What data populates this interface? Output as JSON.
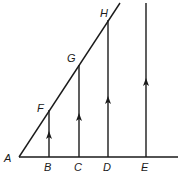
{
  "diagram": {
    "baseline": {
      "from": [
        19,
        157
      ],
      "to": [
        178,
        157
      ]
    },
    "diagonal": {
      "from": [
        19,
        157
      ],
      "to": [
        120,
        3
      ]
    },
    "points": [
      {
        "label": "A",
        "x": 19,
        "y": 157,
        "label_x": 4,
        "label_y": 162
      },
      {
        "label": "B",
        "x": 49,
        "y": 157,
        "label_x": 44,
        "label_y": 171
      },
      {
        "label": "C",
        "x": 79,
        "y": 157,
        "label_x": 74,
        "label_y": 171
      },
      {
        "label": "D",
        "x": 108,
        "y": 157,
        "label_x": 103,
        "label_y": 171
      },
      {
        "label": "E",
        "x": 146,
        "y": 157,
        "label_x": 141,
        "label_y": 171
      },
      {
        "label": "F",
        "x": 49,
        "y": 110,
        "label_x": 37,
        "label_y": 112
      },
      {
        "label": "G",
        "x": 79,
        "y": 65,
        "label_x": 67,
        "label_y": 62
      },
      {
        "label": "H",
        "x": 108,
        "y": 20,
        "label_x": 100,
        "label_y": 17
      }
    ],
    "verticals": [
      {
        "name": "BF",
        "x": 49,
        "y_top": 110,
        "y_bottom": 157,
        "arrow_y": 135
      },
      {
        "name": "CG",
        "x": 79,
        "y_top": 65,
        "y_bottom": 157,
        "arrow_y": 117
      },
      {
        "name": "DH",
        "x": 108,
        "y_top": 20,
        "y_bottom": 157,
        "arrow_y": 100
      },
      {
        "name": "E",
        "x": 146,
        "y_top": 3,
        "y_bottom": 157,
        "arrow_y": 82
      }
    ]
  },
  "labels": {
    "A": "A",
    "B": "B",
    "C": "C",
    "D": "D",
    "E": "E",
    "F": "F",
    "G": "G",
    "H": "H"
  }
}
